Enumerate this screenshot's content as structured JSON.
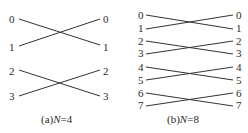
{
  "diagrams": [
    {
      "id": "a",
      "caption_prefix": "(a)",
      "caption_var": "N",
      "caption_eq": "=4",
      "left_labels": [
        "0",
        "1",
        "2",
        "3"
      ],
      "right_labels": [
        "0",
        "1",
        "2",
        "3"
      ],
      "connections": [
        [
          0,
          1
        ],
        [
          1,
          0
        ],
        [
          2,
          3
        ],
        [
          3,
          2
        ]
      ]
    },
    {
      "id": "b",
      "caption_prefix": "(b)",
      "caption_var": "N",
      "caption_eq": "=8",
      "left_labels": [
        "0",
        "1",
        "2",
        "3",
        "4",
        "5",
        "6",
        "7"
      ],
      "right_labels": [
        "0",
        "1",
        "2",
        "3",
        "4",
        "5",
        "6",
        "7"
      ],
      "connections": [
        [
          0,
          1
        ],
        [
          1,
          0
        ],
        [
          2,
          3
        ],
        [
          3,
          2
        ],
        [
          4,
          5
        ],
        [
          5,
          4
        ],
        [
          6,
          7
        ],
        [
          7,
          6
        ]
      ]
    }
  ]
}
